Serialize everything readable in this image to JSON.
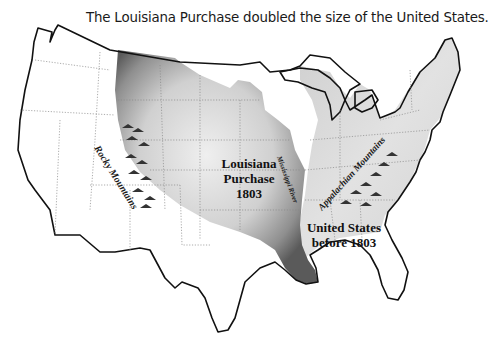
{
  "title": "The Louisiana Purchase doubled the size of the United States.",
  "labels": {
    "rocky": "Rocky Mountains",
    "louisiana_line1": "Louisiana",
    "louisiana_line2": "Purchase",
    "louisiana_line3": "1803",
    "mississippi": "Mississippi River",
    "appalachian": "Appalachian Mountains",
    "us_line1": "United States",
    "us_line2": "before 1803"
  },
  "regions": [
    {
      "name": "Louisiana Purchase",
      "year": "1803",
      "color": "#9a9a9a"
    },
    {
      "name": "United States before 1803",
      "color": "#d4d4d4"
    },
    {
      "name": "Rest of present-day U.S.",
      "color": "#ffffff"
    }
  ]
}
